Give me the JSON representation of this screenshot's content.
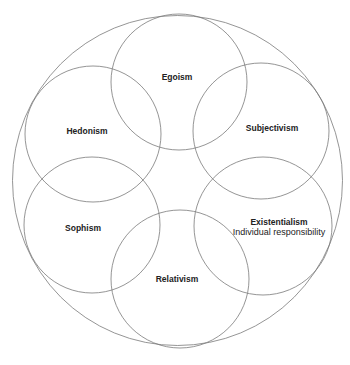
{
  "diagram": {
    "type": "overlapping-circles",
    "stroke_color": "#7a7a7a",
    "text_color": "#222222",
    "background": "#ffffff",
    "outer_circle": {
      "cx": 177.5,
      "cy": 180.5,
      "r": 165
    },
    "circles": [
      {
        "id": "egoism",
        "label": "Egoism",
        "sublabel": "",
        "cx": 179,
        "cy": 82,
        "r": 68,
        "label_x": 177,
        "label_y": 78
      },
      {
        "id": "subjectivism",
        "label": "Subjectivism",
        "sublabel": "",
        "cx": 261,
        "cy": 131,
        "r": 68,
        "label_x": 272,
        "label_y": 129
      },
      {
        "id": "existentialism",
        "label": "Existentialism",
        "sublabel": "Individual responsibility",
        "cx": 263,
        "cy": 226,
        "r": 69,
        "label_x": 279,
        "label_y": 223,
        "sublabel_y": 233
      },
      {
        "id": "relativism",
        "label": "Relativism",
        "sublabel": "",
        "cx": 180,
        "cy": 279,
        "r": 69,
        "label_x": 177,
        "label_y": 280
      },
      {
        "id": "sophism",
        "label": "Sophism",
        "sublabel": "",
        "cx": 92,
        "cy": 225,
        "r": 68,
        "label_x": 83,
        "label_y": 229
      },
      {
        "id": "hedonism",
        "label": "Hedonism",
        "sublabel": "",
        "cx": 93,
        "cy": 134,
        "r": 68,
        "label_x": 87,
        "label_y": 132
      }
    ]
  }
}
